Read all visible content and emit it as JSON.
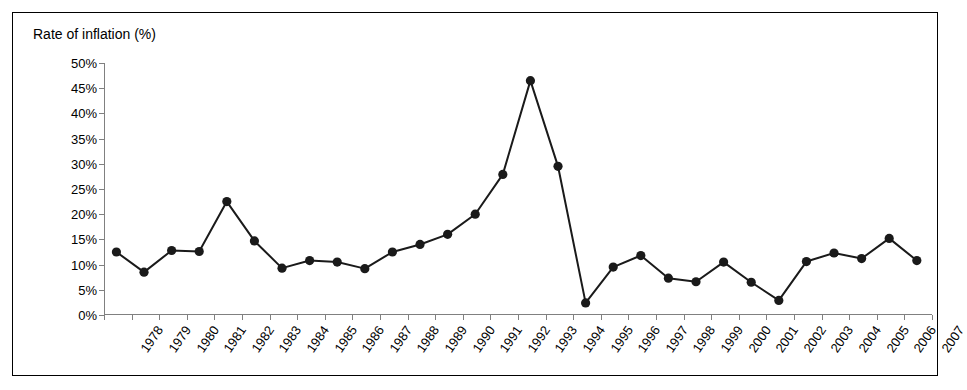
{
  "chart_data": {
    "type": "line",
    "title": "",
    "ylabel": "Rate of inflation (%)",
    "xlabel": "",
    "ylim": [
      0,
      50
    ],
    "ytick_values": [
      0,
      5,
      10,
      15,
      20,
      25,
      30,
      35,
      40,
      45,
      50
    ],
    "ytick_labels": [
      "0%",
      "5%",
      "10%",
      "15%",
      "20%",
      "25%",
      "30%",
      "35%",
      "40%",
      "45%",
      "50%"
    ],
    "grid": false,
    "legend": "none",
    "marker": "filled-circle",
    "line_color": "#1a1a1a",
    "marker_color": "#1a1a1a",
    "categories": [
      "1978",
      "1979",
      "1980",
      "1981",
      "1982",
      "1983",
      "1984",
      "1985",
      "1986",
      "1987",
      "1988",
      "1989",
      "1990",
      "1991",
      "1992",
      "1993",
      "1994",
      "1995",
      "1996",
      "1997",
      "1998",
      "1999",
      "2000",
      "2001",
      "2002",
      "2003",
      "2004",
      "2005",
      "2006",
      "2007"
    ],
    "values": [
      12.5,
      8.5,
      12.8,
      12.6,
      22.5,
      14.7,
      9.3,
      10.8,
      10.5,
      9.2,
      12.5,
      14.0,
      16.0,
      20.0,
      27.9,
      46.5,
      29.5,
      2.4,
      9.5,
      11.8,
      7.3,
      6.6,
      10.5,
      6.5,
      2.9,
      10.6,
      12.3,
      11.2,
      15.2,
      10.8
    ]
  }
}
